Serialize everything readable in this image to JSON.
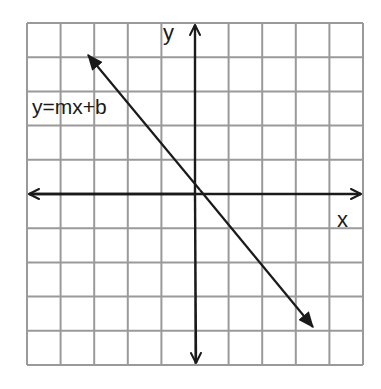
{
  "figure": {
    "kind": "coordinate-plane-line",
    "equation_label": "y=mx+b",
    "x_axis_label": "x",
    "y_axis_label": "y",
    "colors": {
      "grid": "#9a9a9a",
      "axis": "#1a1a1a",
      "line": "#1a1a1a",
      "background": "#ffffff"
    }
  },
  "chart_data": {
    "type": "line",
    "title": "",
    "annotation": "y=mx+b",
    "xlabel": "x",
    "ylabel": "y",
    "xlim": [
      -5,
      5
    ],
    "ylim": [
      -5,
      5
    ],
    "grid": true,
    "grid_cells": {
      "columns": 10,
      "rows": 10
    },
    "axes_arrows": true,
    "tick_labels": false,
    "series": [
      {
        "name": "y=mx+b",
        "endpoints_arrows": true,
        "points": [
          {
            "x": -3.2,
            "y": 4.1
          },
          {
            "x": 3.5,
            "y": -3.9
          }
        ],
        "approx_slope": -1.2,
        "approx_intercept": 0.3
      }
    ]
  },
  "layout": {
    "grid_left": 27,
    "grid_top": 23,
    "grid_right": 363,
    "grid_bottom": 365
  }
}
